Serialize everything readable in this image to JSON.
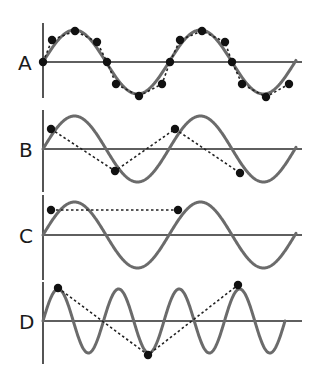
{
  "figure": {
    "colors": {
      "background": "#ffffff",
      "axis": "#2a2a2a",
      "wave": "#6b6b6b",
      "samples": "#111111"
    },
    "axis_x_start": 43,
    "axis_x_end": 302,
    "panels": [
      {
        "label": "A",
        "baseline_y": 62,
        "axis_top": 23,
        "axis_bottom": 98,
        "amplitude": 32,
        "period_px": 126,
        "wave_end_x": 296,
        "description": "Many samples per cycle - reconstructed wave closely follows original",
        "sample_points": [
          [
            43,
            62
          ],
          [
            52,
            40
          ],
          [
            75,
            31
          ],
          [
            97,
            42
          ],
          [
            107,
            62
          ],
          [
            116,
            84
          ],
          [
            139,
            96
          ],
          [
            162,
            84
          ],
          [
            170,
            62
          ],
          [
            180,
            40
          ],
          [
            202,
            31
          ],
          [
            225,
            42
          ],
          [
            232,
            62
          ],
          [
            242,
            84
          ],
          [
            266,
            97
          ],
          [
            289,
            84
          ]
        ]
      },
      {
        "label": "B",
        "baseline_y": 149,
        "axis_top": 110,
        "axis_bottom": 192,
        "amplitude": 33,
        "period_px": 126,
        "wave_end_x": 296,
        "description": "Two samples per cycle at off-peak phase - triangular reconstruction",
        "sample_points": [
          [
            51,
            129
          ],
          [
            115,
            171
          ],
          [
            175,
            129
          ],
          [
            240,
            173
          ]
        ]
      },
      {
        "label": "C",
        "baseline_y": 235,
        "axis_top": 195,
        "axis_bottom": 280,
        "amplitude": 33,
        "period_px": 126,
        "wave_end_x": 296,
        "description": "One sample per cycle - appears as a flat line",
        "sample_points": [
          [
            51,
            210
          ],
          [
            178,
            210
          ]
        ]
      },
      {
        "label": "D",
        "baseline_y": 321,
        "axis_top": 282,
        "axis_bottom": 364,
        "amplitude": 32,
        "period_px": 60.5,
        "wave_end_x": 285,
        "description": "Undersampled high-frequency wave - aliased to lower frequency",
        "sample_points": [
          [
            58,
            288
          ],
          [
            148,
            355
          ],
          [
            238,
            285
          ]
        ]
      }
    ]
  }
}
